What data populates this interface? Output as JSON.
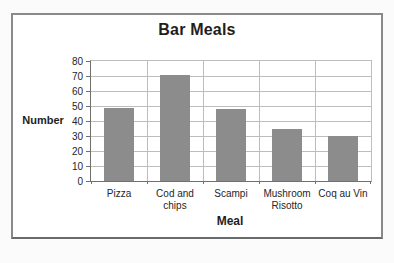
{
  "chart_data": {
    "type": "bar",
    "title": "Bar Meals",
    "xlabel": "Meal",
    "ylabel": "Number",
    "categories": [
      "Pizza",
      "Cod and chips",
      "Scampi",
      "Mushroom Risotto",
      "Coq au Vin"
    ],
    "values": [
      49,
      71,
      48,
      35,
      30
    ],
    "ylim": [
      0,
      80
    ],
    "yticks": [
      0,
      10,
      20,
      30,
      40,
      50,
      60,
      70,
      80
    ],
    "grid": true,
    "legend_position": "none",
    "colors": {
      "bar": "#8c8c8c",
      "gridline": "#bdbdbd",
      "axis": "#707070",
      "text": "#262626",
      "frame_border": "#8a8a8a",
      "plot_background": "#ffffff"
    }
  }
}
